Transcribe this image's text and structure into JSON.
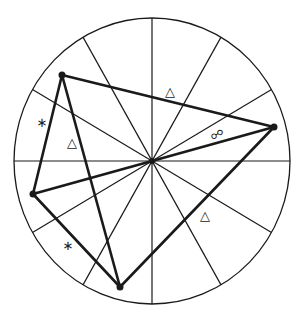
{
  "diagram": {
    "center": {
      "x": 152,
      "y": 161
    },
    "radius": {
      "rx": 138,
      "ry": 143
    },
    "spoke_count": 12,
    "line_color": "#1a1a1a",
    "quadrilateral": {
      "vertices": [
        {
          "name": "top-left",
          "x": 62,
          "y": 75
        },
        {
          "name": "right",
          "x": 274,
          "y": 127
        },
        {
          "name": "bottom",
          "x": 120,
          "y": 287
        },
        {
          "name": "left",
          "x": 33,
          "y": 194
        }
      ],
      "extra_edges": [
        {
          "from": "top-left",
          "to": "bottom"
        },
        {
          "from": "left",
          "to": "center"
        },
        {
          "from": "center",
          "to": "right"
        }
      ]
    },
    "labels": [
      {
        "symbol": "△",
        "x": 170,
        "y": 91,
        "name": "triangle-mark-top"
      },
      {
        "symbol": "∗",
        "x": 42,
        "y": 122,
        "name": "asterisk-mark-upper-left"
      },
      {
        "symbol": "△",
        "x": 72,
        "y": 142,
        "name": "triangle-mark-left"
      },
      {
        "symbol": "☍",
        "x": 217,
        "y": 134,
        "name": "opposition-mark"
      },
      {
        "symbol": "△",
        "x": 205,
        "y": 215,
        "name": "triangle-mark-lower-right"
      },
      {
        "symbol": "∗",
        "x": 68,
        "y": 245,
        "name": "asterisk-mark-lower-left"
      }
    ]
  }
}
